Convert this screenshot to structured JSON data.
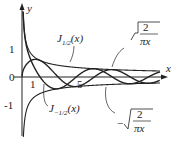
{
  "chart_data": {
    "type": "line",
    "title": "",
    "xlabel": "x",
    "ylabel": "y",
    "yticks": [
      "1",
      "0",
      "-1"
    ],
    "xticks": [
      "1",
      "5"
    ],
    "xlim": [
      0,
      12
    ],
    "ylim": [
      -1.6,
      1.8
    ],
    "series": [
      {
        "name": "J_{1/2}(x)",
        "formula": "sqrt(2/(pi x)) sin x"
      },
      {
        "name": "J_{-1/2}(x)",
        "formula": "sqrt(2/(pi x)) cos x"
      },
      {
        "name": "sqrt(2/(pi x))",
        "formula": "envelope upper"
      },
      {
        "name": "-sqrt(2/(pi x))",
        "formula": "envelope lower"
      }
    ],
    "annotations": [
      {
        "text": "J_{1/2}(x)"
      },
      {
        "text": "J_{-1/2}(x)"
      },
      {
        "text": "sqrt(2/(πx))"
      },
      {
        "text": "-sqrt(2/(πx))"
      }
    ]
  },
  "labels": {
    "x": "x",
    "y": "y",
    "one": "1",
    "zero": "0",
    "minus_one": "-1",
    "tick1": "1",
    "tick5": "5",
    "j_half": "J",
    "j_half_sub": "1/2",
    "j_half_arg": "(x)",
    "j_mhalf": "J",
    "j_mhalf_sub": "−1/2",
    "j_mhalf_arg": "(x)",
    "two": "2",
    "pix": "πx",
    "minus": "−"
  }
}
